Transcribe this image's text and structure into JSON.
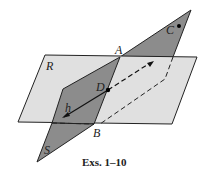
{
  "diagram": {
    "planes": [
      {
        "name": "R",
        "color": "#dcdcdc"
      },
      {
        "name": "S",
        "color": "#8c8c8c"
      }
    ],
    "points": [
      "A",
      "B",
      "C",
      "D"
    ],
    "line": "h",
    "labels": {
      "R": "R",
      "S": "S",
      "A": "A",
      "B": "B",
      "C": "C",
      "D": "D",
      "h": "h"
    },
    "caption": "Exs. 1–10"
  }
}
